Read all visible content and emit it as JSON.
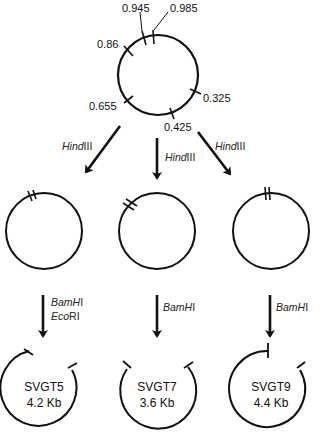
{
  "parent_plasmid": {
    "site_labels": {
      "s0945": "0.945",
      "s0985": "0.985",
      "s086": "0.86",
      "s0655": "0.655",
      "s0325": "0.325",
      "s0425": "0.425"
    }
  },
  "step1": {
    "enzyme_left": {
      "name": "Hind",
      "suffix": "III"
    },
    "enzyme_center": {
      "name": "Hind",
      "suffix": "III"
    },
    "enzyme_right": {
      "name": "Hind",
      "suffix": "III"
    }
  },
  "step2": {
    "left": {
      "line1_name": "BamH",
      "line1_suffix": "I",
      "line2_name": "Eco",
      "line2_suffix": "RI"
    },
    "center": {
      "name": "BamH",
      "suffix": "I"
    },
    "right": {
      "name": "BamH",
      "suffix": "I"
    }
  },
  "products": [
    {
      "name": "SVGT5",
      "size": "4.2 Kb"
    },
    {
      "name": "SVGT7",
      "size": "3.6 Kb"
    },
    {
      "name": "SVGT9",
      "size": "4.4 Kb"
    }
  ]
}
